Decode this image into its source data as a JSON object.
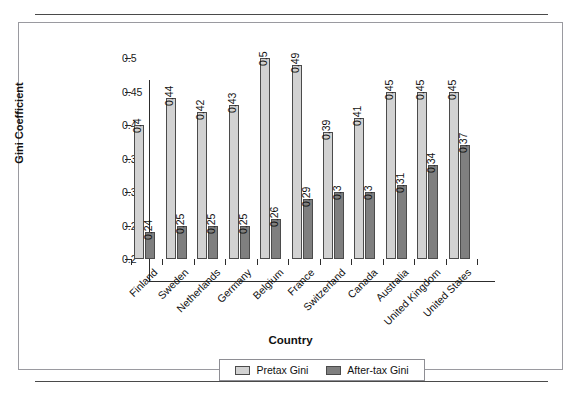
{
  "chart_data": {
    "type": "bar",
    "title": "",
    "xlabel": "Country",
    "ylabel": "Gini Coefficient",
    "ylim": [
      0.2,
      0.5
    ],
    "yticks": [
      "0.2",
      "0.25",
      "0.3",
      "0.35",
      "0.4",
      "0.45",
      "0.5"
    ],
    "grid": false,
    "legend_position": "bottom",
    "categories": [
      "Finland",
      "Sweden",
      "Netherlands",
      "Germany",
      "Belgium",
      "France",
      "Switzerland",
      "Canada",
      "Australia",
      "United Kingdom",
      "United States"
    ],
    "series": [
      {
        "name": "Pretax Gini",
        "color": "#d2d2d2",
        "values": [
          0.4,
          0.44,
          0.42,
          0.43,
          0.5,
          0.49,
          0.39,
          0.41,
          0.45,
          0.45,
          0.45
        ],
        "labels": [
          "0.4",
          "0.44",
          "0.42",
          "0.43",
          "0.5",
          "0.49",
          "0.39",
          "0.41",
          "0.45",
          "0.45",
          "0.45"
        ]
      },
      {
        "name": "After-tax Gini",
        "color": "#7f7f7f",
        "values": [
          0.24,
          0.25,
          0.25,
          0.25,
          0.26,
          0.29,
          0.3,
          0.3,
          0.31,
          0.34,
          0.37
        ],
        "labels": [
          "0.24",
          "0.25",
          "0.25",
          "0.25",
          "0.26",
          "0.29",
          "0.3",
          "0.3",
          "0.31",
          "0.34",
          "0.37"
        ]
      }
    ]
  },
  "legend": {
    "items": [
      {
        "label": "Pretax Gini",
        "swatch": "pretax"
      },
      {
        "label": "After-tax Gini",
        "swatch": "aftertax"
      }
    ]
  }
}
